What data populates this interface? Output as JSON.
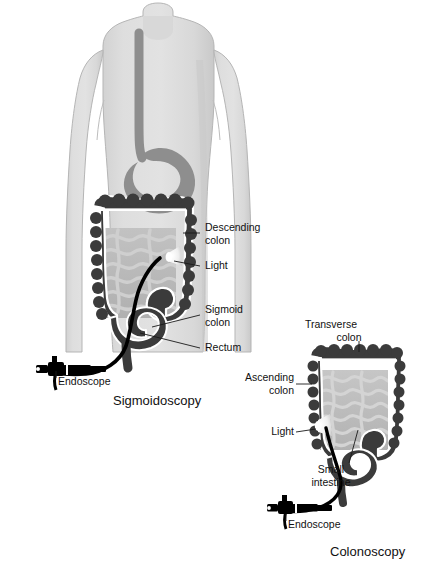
{
  "figure": {
    "background_color": "#ffffff",
    "palette": {
      "body_fill": "#dcdcdc",
      "body_shadow": "#cfcfcf",
      "body_outline": "#b8b8b8",
      "organ_gray": "#8e8e8e",
      "colon_dark": "#3b3b3b",
      "colon_outline": "#ffffff",
      "small_intestine": "#a9a9a9",
      "small_intestine_bg": "#bdbdbd",
      "scope_black": "#000000",
      "light_cone": "#f2f2f2",
      "leader_line": "#1a1a1a",
      "text": "#111111"
    }
  },
  "panels": [
    {
      "id": "sigmoidoscopy",
      "caption": "Sigmoidoscopy",
      "caption_pos": {
        "x": 113,
        "y": 400
      },
      "labels": [
        {
          "id": "descending-colon",
          "text_lines": [
            "Descending",
            "colon"
          ],
          "x": 205,
          "y": 228,
          "leader": "M200,233 L183,233"
        },
        {
          "id": "light",
          "text_lines": [
            "Light"
          ],
          "x": 205,
          "y": 266,
          "leader": "M200,266 L174,262"
        },
        {
          "id": "sigmoid-colon",
          "text_lines": [
            "Sigmoid",
            "colon"
          ],
          "x": 205,
          "y": 310,
          "leader": "M200,315 L152,326"
        },
        {
          "id": "rectum",
          "text_lines": [
            "Rectum"
          ],
          "x": 205,
          "y": 348,
          "leader": "M200,348 L142,334"
        },
        {
          "id": "endoscope",
          "text_lines": [
            "Endoscope"
          ],
          "x": 58,
          "y": 382,
          "leader": "M56,378 L56,372"
        }
      ]
    },
    {
      "id": "colonoscopy",
      "caption": "Colonoscopy",
      "caption_pos": {
        "x": 330,
        "y": 552
      },
      "labels": [
        {
          "id": "transverse-colon",
          "text_lines": [
            "Transverse",
            "colon"
          ],
          "x": 331,
          "y": 325,
          "leader": "M359,341 L359,352"
        },
        {
          "id": "ascending-colon",
          "text_lines": [
            "Ascending",
            "colon"
          ],
          "x": 292,
          "y": 378,
          "leader": "M294,384 L311,384",
          "anchor": "end"
        },
        {
          "id": "light-right",
          "text_lines": [
            "Light"
          ],
          "x": 292,
          "y": 432,
          "leader": "M294,432 L315,430",
          "anchor": "end"
        },
        {
          "id": "small-intestine",
          "text_lines": [
            "Small",
            "intestine"
          ],
          "x": 331,
          "y": 470,
          "leader": "M347,464 L357,430",
          "anchor": "middle"
        },
        {
          "id": "endoscope-right",
          "text_lines": [
            "Endoscope"
          ],
          "x": 288,
          "y": 525,
          "leader": "M286,521 L286,515"
        }
      ]
    }
  ]
}
